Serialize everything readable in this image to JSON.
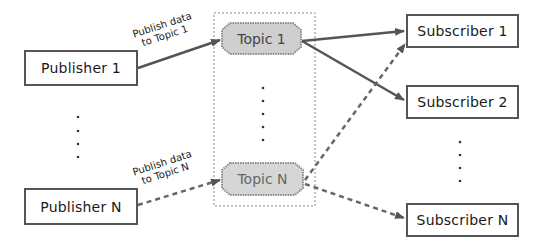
{
  "diagram": {
    "type": "publish-subscribe",
    "publishers": [
      {
        "id": "pub1",
        "label": "Publisher 1"
      },
      {
        "id": "pubN",
        "label": "Publisher N"
      }
    ],
    "topics": [
      {
        "id": "topic1",
        "label": "Topic 1"
      },
      {
        "id": "topicN",
        "label": "Topic N"
      }
    ],
    "subscribers": [
      {
        "id": "sub1",
        "label": "Subscriber 1"
      },
      {
        "id": "sub2",
        "label": "Subscriber 2"
      },
      {
        "id": "subN",
        "label": "Subscriber N"
      }
    ],
    "edges": [
      {
        "from": "pub1",
        "to": "topic1",
        "style": "solid",
        "label_line1": "Publish data",
        "label_line2": "to Topic 1"
      },
      {
        "from": "pubN",
        "to": "topicN",
        "style": "dashed",
        "label_line1": "Publish data",
        "label_line2": "to Topic N"
      },
      {
        "from": "topic1",
        "to": "sub1",
        "style": "solid"
      },
      {
        "from": "topic1",
        "to": "sub2",
        "style": "solid"
      },
      {
        "from": "topicN",
        "to": "sub1",
        "style": "dashed"
      },
      {
        "from": "topicN",
        "to": "subN",
        "style": "dashed"
      }
    ],
    "ellipsis": "⋮",
    "colors": {
      "box_border": "#555555",
      "arrow": "#555555",
      "topic_fill": "#cccccc",
      "topic_border": "#888888",
      "topic_text": "#555555",
      "container_border": "#888888"
    }
  }
}
